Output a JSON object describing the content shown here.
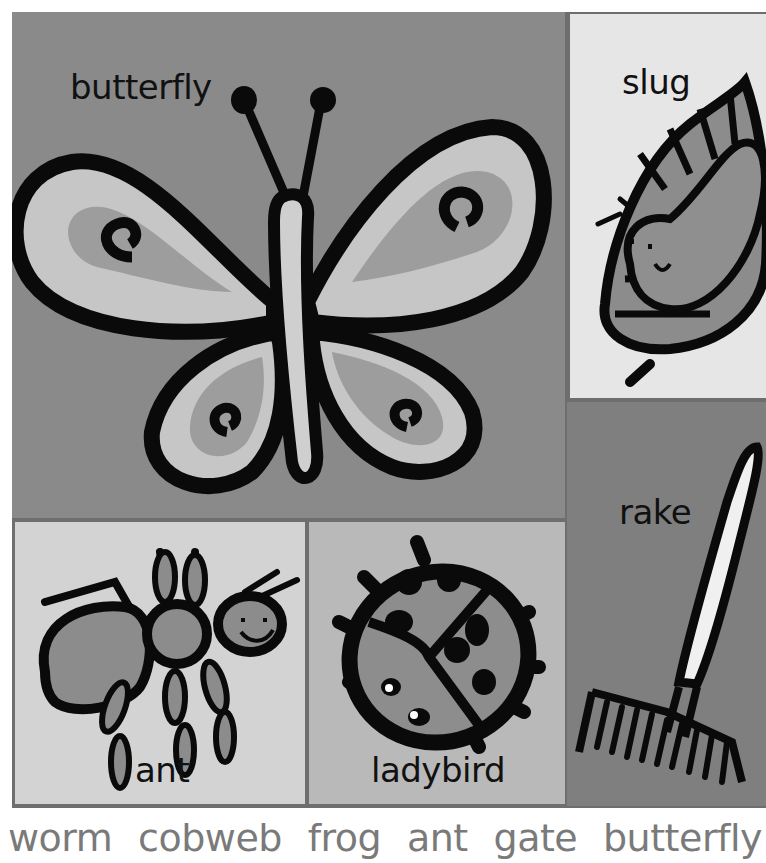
{
  "panels": {
    "butterfly": {
      "label": "butterfly"
    },
    "slug": {
      "label": "slug"
    },
    "rake": {
      "label": "rake"
    },
    "ant": {
      "label": "ant"
    },
    "ladybird": {
      "label": "ladybird"
    }
  },
  "word_list": [
    "worm",
    "cobweb",
    "frog",
    "ant",
    "gate",
    "butterfly"
  ],
  "colors": {
    "frame": "#6e6e6e",
    "butterfly_bg": "#8a8a8a",
    "slug_bg": "#e6e6e6",
    "rake_bg": "#7f7f7f",
    "ant_bg": "#d3d3d3",
    "ladybird_bg": "#b9b9b9",
    "outline": "#0a0a0a",
    "word_text": "#7a7a7a"
  }
}
